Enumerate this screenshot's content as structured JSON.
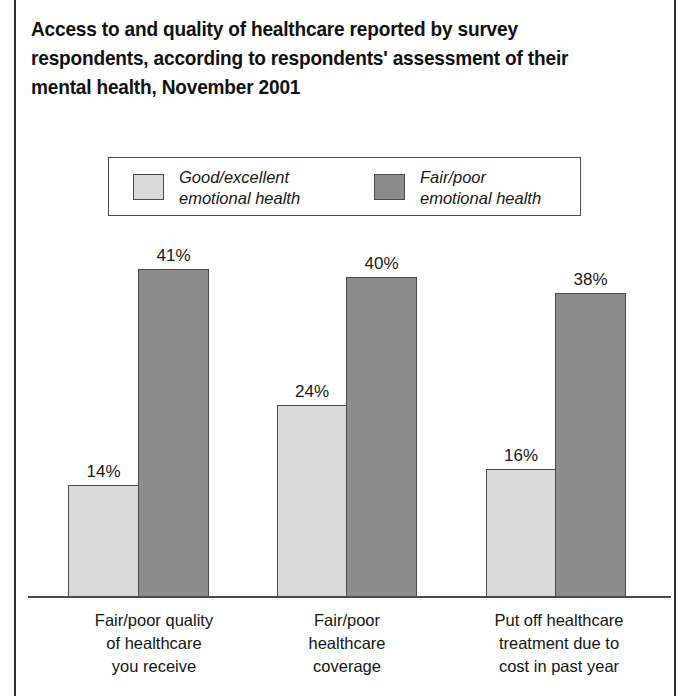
{
  "figure": {
    "title_lines": [
      "Access to and quality of healthcare reported by survey",
      "respondents, according to respondents' assessment of their",
      "mental health, November 2001"
    ],
    "colors": {
      "series_good": "#d9d9d9",
      "series_fair": "#8c8c8c",
      "outline": "#4b4b4b",
      "text": "#181818",
      "frame": "#2f2f2f"
    }
  },
  "legend": {
    "items": [
      {
        "name": "good-excellent",
        "line1": "Good/excellent",
        "line2": "emotional health"
      },
      {
        "name": "fair-poor",
        "line1": "Fair/poor",
        "line2": "emotional health"
      }
    ]
  },
  "categories": [
    {
      "line1": "Fair/poor quality",
      "line2": "of healthcare",
      "line3": "you receive"
    },
    {
      "line1": "Fair/poor",
      "line2": "healthcare",
      "line3": "coverage",
      "line4": ""
    },
    {
      "line1": "Put off healthcare",
      "line2": "treatment due to",
      "line3": "cost in past year"
    }
  ],
  "bar_labels": {
    "g1_light": "14%",
    "g1_dark": "41%",
    "g2_light": "24%",
    "g2_dark": "40%",
    "g3_light": "16%",
    "g3_dark": "38%"
  },
  "chart_data": {
    "type": "bar",
    "title": "Access to and quality of healthcare reported by survey respondents, according to respondents' assessment of their mental health, November 2001",
    "xlabel": "",
    "ylabel": "",
    "ylim": [
      0,
      45
    ],
    "grid": false,
    "legend_position": "top-center",
    "value_suffix": "%",
    "categories": [
      "Fair/poor quality of healthcare you receive",
      "Fair/poor healthcare coverage",
      "Put off healthcare treatment due to cost in past year"
    ],
    "series": [
      {
        "name": "Good/excellent emotional health",
        "color": "#d9d9d9",
        "values": [
          14,
          24,
          16
        ]
      },
      {
        "name": "Fair/poor emotional health",
        "color": "#8c8c8c",
        "values": [
          41,
          40,
          38
        ]
      }
    ]
  }
}
